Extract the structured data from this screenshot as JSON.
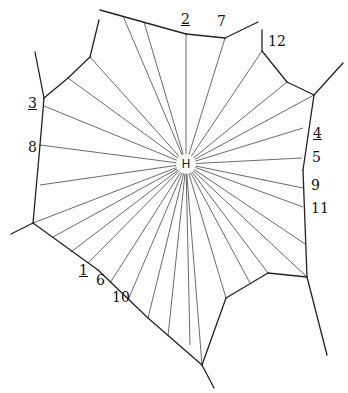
{
  "diagram": {
    "type": "voronoi-territory",
    "center": {
      "label": "H",
      "x": 186,
      "y": 164
    },
    "boundary_edges": [
      [
        [
          100,
          10
        ],
        [
          186,
          34
        ]
      ],
      [
        [
          186,
          34
        ],
        [
          225,
          38
        ]
      ],
      [
        [
          225,
          38
        ],
        [
          258,
          22
        ]
      ],
      [
        [
          99,
          20
        ],
        [
          90,
          57
        ]
      ],
      [
        [
          90,
          57
        ],
        [
          68,
          78
        ]
      ],
      [
        [
          68,
          78
        ],
        [
          44,
          98
        ]
      ],
      [
        [
          35,
          52
        ],
        [
          44,
          98
        ]
      ],
      [
        [
          44,
          98
        ],
        [
          40,
          145
        ]
      ],
      [
        [
          40,
          145
        ],
        [
          33,
          223
        ]
      ],
      [
        [
          33,
          223
        ],
        [
          11,
          234
        ]
      ],
      [
        [
          33,
          223
        ],
        [
          98,
          270
        ]
      ],
      [
        [
          98,
          270
        ],
        [
          148,
          318
        ]
      ],
      [
        [
          148,
          318
        ],
        [
          202,
          365
        ]
      ],
      [
        [
          202,
          365
        ],
        [
          214,
          388
        ]
      ],
      [
        [
          202,
          365
        ],
        [
          226,
          298
        ]
      ],
      [
        [
          226,
          298
        ],
        [
          268,
          273
        ]
      ],
      [
        [
          268,
          273
        ],
        [
          307,
          277
        ]
      ],
      [
        [
          307,
          277
        ],
        [
          327,
          355
        ]
      ],
      [
        [
          307,
          277
        ],
        [
          303,
          170
        ]
      ],
      [
        [
          303,
          170
        ],
        [
          314,
          95
        ]
      ],
      [
        [
          314,
          95
        ],
        [
          343,
          63
        ]
      ],
      [
        [
          314,
          95
        ],
        [
          287,
          82
        ]
      ],
      [
        [
          287,
          82
        ],
        [
          262,
          51
        ]
      ],
      [
        [
          262,
          51
        ],
        [
          262,
          30
        ]
      ]
    ],
    "spoke_ends": [
      [
        186,
        34
      ],
      [
        144,
        22
      ],
      [
        123,
        16
      ],
      [
        225,
        38
      ],
      [
        262,
        51
      ],
      [
        287,
        82
      ],
      [
        314,
        95
      ],
      [
        303,
        128
      ],
      [
        302,
        158
      ],
      [
        303,
        188
      ],
      [
        303,
        207
      ],
      [
        305,
        244
      ],
      [
        307,
        277
      ],
      [
        268,
        273
      ],
      [
        250,
        283
      ],
      [
        226,
        298
      ],
      [
        202,
        365
      ],
      [
        190,
        345
      ],
      [
        168,
        336
      ],
      [
        148,
        318
      ],
      [
        128,
        300
      ],
      [
        110,
        283
      ],
      [
        88,
        263
      ],
      [
        71,
        252
      ],
      [
        53,
        237
      ],
      [
        33,
        223
      ],
      [
        40,
        185
      ],
      [
        40,
        145
      ],
      [
        44,
        106
      ],
      [
        68,
        78
      ],
      [
        90,
        57
      ]
    ],
    "labels": [
      {
        "text": "2",
        "x": 181,
        "y": 12,
        "underline": true
      },
      {
        "text": "7",
        "x": 217,
        "y": 14,
        "underline": false
      },
      {
        "text": "12",
        "x": 268,
        "y": 34,
        "underline": false
      },
      {
        "text": "3",
        "x": 28,
        "y": 96,
        "underline": true
      },
      {
        "text": "8",
        "x": 28,
        "y": 140,
        "underline": false
      },
      {
        "text": "4",
        "x": 313,
        "y": 126,
        "underline": true
      },
      {
        "text": "5",
        "x": 312,
        "y": 150,
        "underline": false
      },
      {
        "text": "9",
        "x": 311,
        "y": 178,
        "underline": false
      },
      {
        "text": "11",
        "x": 311,
        "y": 201,
        "underline": false
      },
      {
        "text": "1",
        "x": 79,
        "y": 263,
        "underline": true
      },
      {
        "text": "6",
        "x": 96,
        "y": 273,
        "underline": false
      },
      {
        "text": "10",
        "x": 112,
        "y": 290,
        "underline": false
      }
    ]
  }
}
